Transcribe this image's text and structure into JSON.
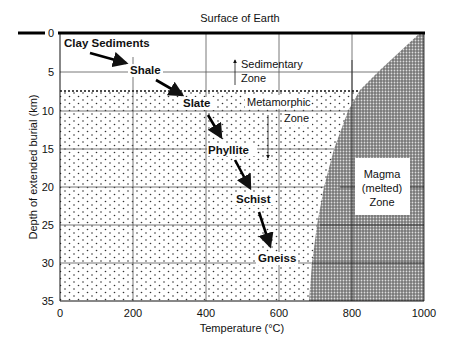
{
  "title": "Surface of Earth",
  "axes": {
    "xlabel": "Temperature (°C)",
    "ylabel": "Depth of extended burial (km)",
    "xticks": [
      "0",
      "200",
      "400",
      "600",
      "800",
      "1000"
    ],
    "yticks": [
      "0",
      "5",
      "10",
      "15",
      "20",
      "25",
      "30",
      "35"
    ]
  },
  "zones": {
    "sedimentary": [
      "Sedimentary",
      "Zone"
    ],
    "metamorphic": [
      "Metamorphic",
      "Zone"
    ],
    "magma": [
      "Magma",
      "(melted)",
      "Zone"
    ]
  },
  "rocks": [
    "Clay Sediments",
    "Shale",
    "Slate",
    "Phyllite",
    "Schist",
    "Gneiss"
  ],
  "colors": {
    "line": "#111111",
    "magma_fill": "#555555",
    "dots": "#333333"
  }
}
